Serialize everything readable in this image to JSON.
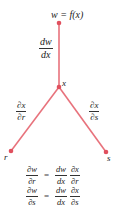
{
  "diagram": {
    "type": "chain-rule-tree",
    "colors": {
      "branch": "#e8727c",
      "node": "#e0505e",
      "text": "#222222"
    },
    "nodes": {
      "top": {
        "label": "w = f(x)",
        "x": 59,
        "y": 23
      },
      "middle": {
        "label": "x",
        "x": 59,
        "y": 87
      },
      "left": {
        "label": "r",
        "x": 11,
        "y": 151
      },
      "right": {
        "label": "s",
        "x": 106,
        "y": 152
      }
    },
    "edges": {
      "top_to_middle": {
        "num": "dw",
        "den": "dx"
      },
      "middle_to_left": {
        "num": "∂x",
        "den": "∂r"
      },
      "middle_to_right": {
        "num": "∂x",
        "den": "∂s"
      }
    },
    "equations": [
      {
        "lhs": {
          "num": "∂w",
          "den": "∂r"
        },
        "equals": "=",
        "rhs1": {
          "num": "dw",
          "den": "dx"
        },
        "rhs2": {
          "num": "∂x",
          "den": "∂r"
        }
      },
      {
        "lhs": {
          "num": "∂w",
          "den": "∂s"
        },
        "equals": "=",
        "rhs1": {
          "num": "dw",
          "den": "dx"
        },
        "rhs2": {
          "num": "∂x",
          "den": "∂s"
        }
      }
    ]
  }
}
